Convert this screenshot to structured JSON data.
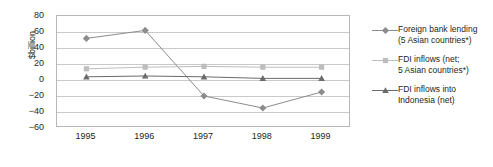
{
  "chart_data": {
    "type": "line",
    "title": "",
    "subtitle": "",
    "xlabel": "",
    "ylabel": "$billion",
    "categories": [
      "1995",
      "1996",
      "1997",
      "1998",
      "1999"
    ],
    "ylim": [
      -60,
      80
    ],
    "ytick_labels": [
      "80",
      "60",
      "40",
      "20",
      "0",
      "−20",
      "−40",
      "−60"
    ],
    "ytick_values": [
      80,
      60,
      40,
      20,
      0,
      -20,
      -40,
      -60
    ],
    "grid": "horizontal",
    "legend_position": "right",
    "series": [
      {
        "name": "Foreign bank lending\n(5 Asian countries*)",
        "marker": "diamond",
        "color": "#8c8c8c",
        "values": [
          52,
          62,
          -20,
          -35,
          -15
        ]
      },
      {
        "name": "FDI inflows (net;\n5 Asian countries*)",
        "marker": "square",
        "color": "#bdbdbd",
        "values": [
          14,
          16,
          17,
          16,
          16
        ]
      },
      {
        "name": "FDI inflows into\nIndonesia (net)",
        "marker": "triangle",
        "color": "#6b6b6b",
        "values": [
          4,
          5,
          4,
          2,
          2
        ]
      }
    ]
  },
  "legend": {
    "items": [
      {
        "label": "Foreign bank lending\n(5 Asian countries*)",
        "marker": "diamond-marker",
        "color": "#8c8c8c"
      },
      {
        "label": "FDI inflows (net;\n5 Asian countries*)",
        "marker": "square-marker",
        "color": "#bdbdbd"
      },
      {
        "label": "FDI inflows into\nIndonesia (net)",
        "marker": "triangle-marker",
        "color": "#6b6b6b"
      }
    ]
  },
  "colors": {
    "frame": "#b8b8b8",
    "grid": "#c9c9c9",
    "text": "#231f20",
    "background": "#ffffff"
  }
}
